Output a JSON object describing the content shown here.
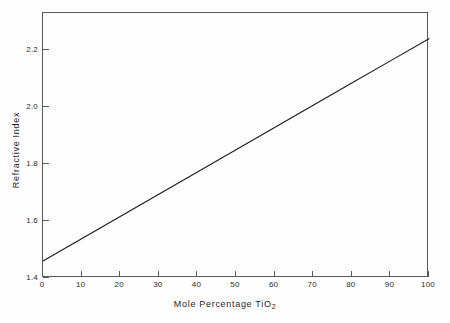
{
  "chart_data": {
    "type": "line",
    "title": "",
    "xlabel": "Mole Percentage TiO2",
    "xlabel_base": "Mole  Percentage  TiO",
    "xlabel_sub": "2",
    "ylabel": "Refractive Index",
    "xlim": [
      0,
      100
    ],
    "ylim": [
      1.4,
      2.33
    ],
    "xticks": [
      0,
      10,
      20,
      30,
      40,
      50,
      60,
      70,
      80,
      90,
      100
    ],
    "xticklabels": [
      "0",
      "10",
      "20",
      "30",
      "40",
      "50",
      "60",
      "70",
      "80",
      "90",
      "100"
    ],
    "yticks": [
      1.4,
      1.6,
      1.8,
      2.0,
      2.2
    ],
    "yticklabels": [
      "1.4",
      "1.6",
      "1.8",
      "2.0",
      "2.2"
    ],
    "grid": false,
    "legend": null,
    "series": [
      {
        "name": "Refractive index vs mole percentage TiO2",
        "color": "#1a1a1a",
        "linewidth": 1.1,
        "x": [
          0,
          10,
          20,
          30,
          40,
          50,
          60,
          70,
          80,
          90,
          100
        ],
        "values": [
          1.46,
          1.538,
          1.616,
          1.694,
          1.772,
          1.85,
          1.928,
          2.006,
          2.084,
          2.162,
          2.24
        ]
      }
    ],
    "annotations": []
  },
  "figure": {
    "background_color": "#fefefe",
    "frame_color": "#55585c",
    "text_color": "#1e1e1e"
  }
}
